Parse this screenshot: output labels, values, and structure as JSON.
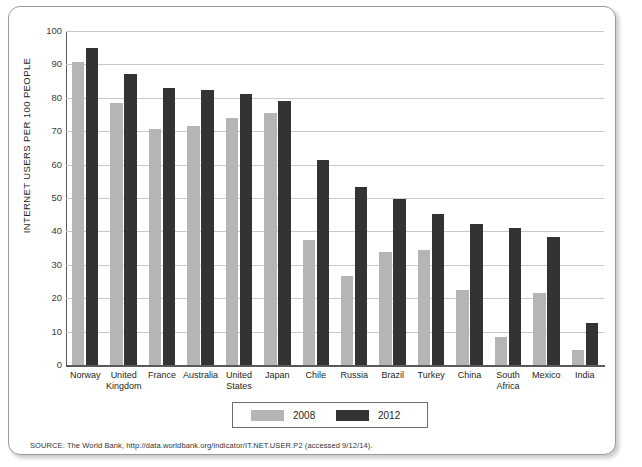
{
  "figure": {
    "source_note": "SOURCE: The World Bank, http://data.worldbank.org/indicator/IT.NET.USER.P2 (accessed 9/12/14).",
    "legend_title_2008": "2008",
    "legend_title_2012": "2012"
  },
  "chart_data": {
    "type": "bar",
    "title": "",
    "xlabel": "",
    "ylabel": "INTERNET USERS PER 100 PEOPLE",
    "ylim": [
      0,
      100
    ],
    "ytick_labels": [
      "0",
      "10",
      "20",
      "30",
      "40",
      "50",
      "60",
      "70",
      "80",
      "90",
      "100"
    ],
    "ytick_values": [
      0,
      10,
      20,
      30,
      40,
      50,
      60,
      70,
      80,
      90,
      100
    ],
    "grid": true,
    "legend_position": "bottom-center",
    "categories": [
      "Norway",
      "United Kingdom",
      "France",
      "Australia",
      "United States",
      "Japan",
      "Chile",
      "Russia",
      "Brazil",
      "Turkey",
      "China",
      "South Africa",
      "Mexico",
      "India"
    ],
    "series": [
      {
        "name": "2008",
        "color": "#b5b5b5",
        "values": [
          90.6,
          78.4,
          70.7,
          71.7,
          74.0,
          75.4,
          37.3,
          26.8,
          33.8,
          34.4,
          22.6,
          8.4,
          21.7,
          4.4
        ]
      },
      {
        "name": "2012",
        "color": "#333333",
        "values": [
          95.0,
          87.0,
          83.0,
          82.3,
          81.0,
          79.1,
          61.4,
          53.3,
          49.8,
          45.1,
          42.3,
          41.0,
          38.4,
          12.6
        ]
      }
    ]
  }
}
